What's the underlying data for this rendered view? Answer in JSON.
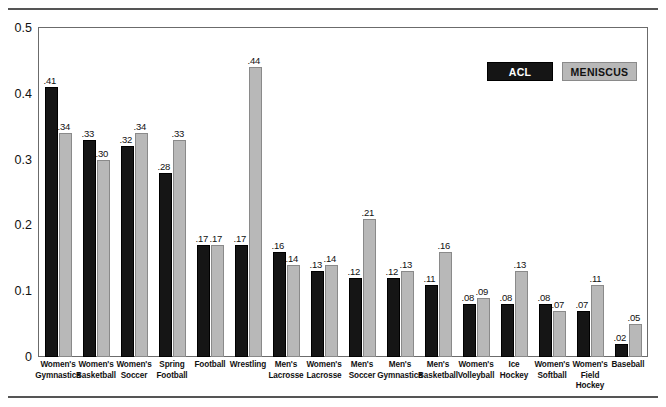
{
  "chart_data": {
    "type": "bar",
    "title": "",
    "xlabel": "",
    "ylabel": "",
    "ylim": [
      0,
      0.5
    ],
    "yticks": [
      "0",
      "0.1",
      "0.2",
      "0.3",
      "0.4",
      "0.5"
    ],
    "ytick_values": [
      0,
      0.1,
      0.2,
      0.3,
      0.4,
      0.5
    ],
    "grid": false,
    "legend_position": "top-right",
    "categories": [
      "Women's Gymnastics",
      "Women's Basketball",
      "Women's Soccer",
      "Spring Football",
      "Football",
      "Wrestling",
      "Men's Lacrosse",
      "Women's Lacrosse",
      "Men's Soccer",
      "Men's Gymnastics",
      "Men's Basketball",
      "Women's Volleyball",
      "Ice Hockey",
      "Women's Softball",
      "Women's Field Hockey",
      "Baseball"
    ],
    "category_lines": [
      [
        "Women's",
        "Gymnastics"
      ],
      [
        "Women's",
        "Basketball"
      ],
      [
        "Women's",
        "Soccer"
      ],
      [
        "Spring",
        "Football"
      ],
      [
        "Football"
      ],
      [
        "Wrestling"
      ],
      [
        "Men's",
        "Lacrosse"
      ],
      [
        "Women's",
        "Lacrosse"
      ],
      [
        "Men's",
        "Soccer"
      ],
      [
        "Men's",
        "Gymnastics"
      ],
      [
        "Men's",
        "Basketball"
      ],
      [
        "Women's",
        "Volleyball"
      ],
      [
        "Ice",
        "Hockey"
      ],
      [
        "Women's",
        "Softball"
      ],
      [
        "Women's",
        "Field",
        "Hockey"
      ],
      [
        "Baseball"
      ]
    ],
    "series": [
      {
        "name": "ACL",
        "color": "#151515",
        "values": [
          0.41,
          0.33,
          0.32,
          0.28,
          0.17,
          0.17,
          0.16,
          0.13,
          0.12,
          0.12,
          0.11,
          0.08,
          0.08,
          0.08,
          0.07,
          0.02
        ],
        "labels": [
          ".41",
          ".33",
          ".32",
          ".28",
          ".17",
          ".17",
          ".16",
          ".13",
          ".12",
          ".12",
          ".11",
          ".08",
          ".08",
          ".08",
          ".07",
          ".02"
        ]
      },
      {
        "name": "MENISCUS",
        "color": "#b8b8b8",
        "values": [
          0.34,
          0.3,
          0.34,
          0.33,
          0.17,
          0.44,
          0.14,
          0.14,
          0.21,
          0.13,
          0.16,
          0.09,
          0.13,
          0.07,
          0.11,
          0.05
        ],
        "labels": [
          ".34",
          ".30",
          ".34",
          ".33",
          ".17",
          ".44",
          ".14",
          ".14",
          ".21",
          ".13",
          ".16",
          ".09",
          ".13",
          ".07",
          ".11",
          ".05"
        ]
      }
    ]
  },
  "legend": {
    "items": [
      {
        "label": "ACL",
        "color": "#151515"
      },
      {
        "label": "MENISCUS",
        "color": "#b8b8b8"
      }
    ]
  }
}
